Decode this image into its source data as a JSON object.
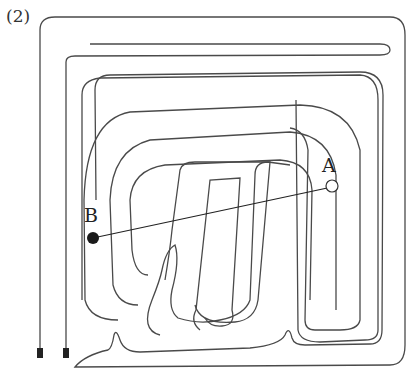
{
  "figure": {
    "label": "(2)",
    "points": {
      "A": {
        "label": "A",
        "style": "open-circle"
      },
      "B": {
        "label": "B",
        "style": "filled-circle"
      }
    },
    "colors": {
      "stroke": "#4a4a4a",
      "background": "#ffffff"
    }
  }
}
